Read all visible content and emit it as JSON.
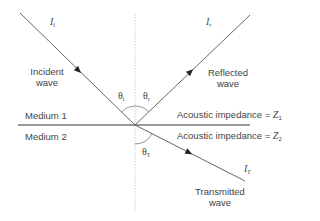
{
  "diagram": {
    "rays": {
      "incident": {
        "intensity_symbol": "I",
        "intensity_sub": "i",
        "label_line1": "Incident",
        "label_line2": "wave"
      },
      "reflected": {
        "intensity_symbol": "I",
        "intensity_sub": "r",
        "label_line1": "Reflected",
        "label_line2": "wave"
      },
      "transmitted": {
        "intensity_symbol": "I",
        "intensity_sub": "T",
        "label_line1": "Transmitted",
        "label_line2": "wave"
      }
    },
    "angles": {
      "incident": {
        "symbol": "θ",
        "sub": "i"
      },
      "reflected": {
        "symbol": "θ",
        "sub": "r"
      },
      "transmitted": {
        "symbol": "θ",
        "sub": "T"
      }
    },
    "media": {
      "medium1": {
        "label": "Medium 1",
        "impedance_text": "Acoustic impedance = ",
        "impedance_symbol": "Z",
        "impedance_sub": "1"
      },
      "medium2": {
        "label": "Medium 2",
        "impedance_text": "Acoustic impedance = ",
        "impedance_symbol": "Z",
        "impedance_sub": "2"
      }
    },
    "colors": {
      "line": "#555555",
      "interface": "#333333",
      "normal": "#bbbbbb",
      "text": "#444444"
    }
  }
}
